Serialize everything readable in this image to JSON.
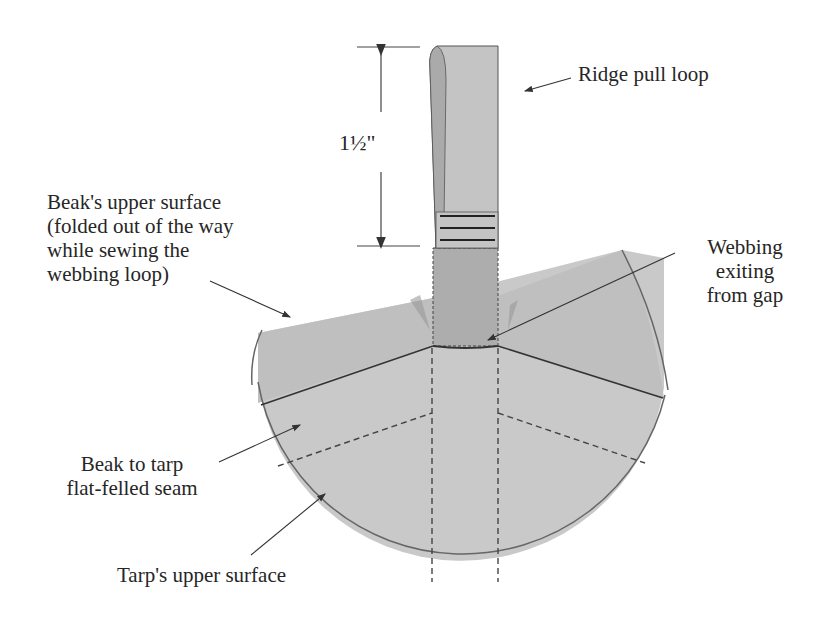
{
  "diagram": {
    "colors": {
      "tarp": "#c9c9c9",
      "beak": "#bdbdbd",
      "webbing_loop": "#c2c2c2",
      "webbing_lower": "#a9a9a9",
      "line": "#333333",
      "background": "#ffffff"
    },
    "dimension": {
      "label": "1½\""
    },
    "labels": {
      "ridge_pull_loop": "Ridge pull loop",
      "beak_upper_surface": [
        "Beak's upper surface",
        "(folded out of the way",
        "while sewing the",
        "webbing loop)"
      ],
      "webbing_exiting": [
        "Webbing",
        "exiting",
        "from gap"
      ],
      "beak_to_tarp_seam": [
        "Beak to tarp",
        "flat-felled seam"
      ],
      "tarp_upper_surface": "Tarp's upper surface"
    }
  }
}
